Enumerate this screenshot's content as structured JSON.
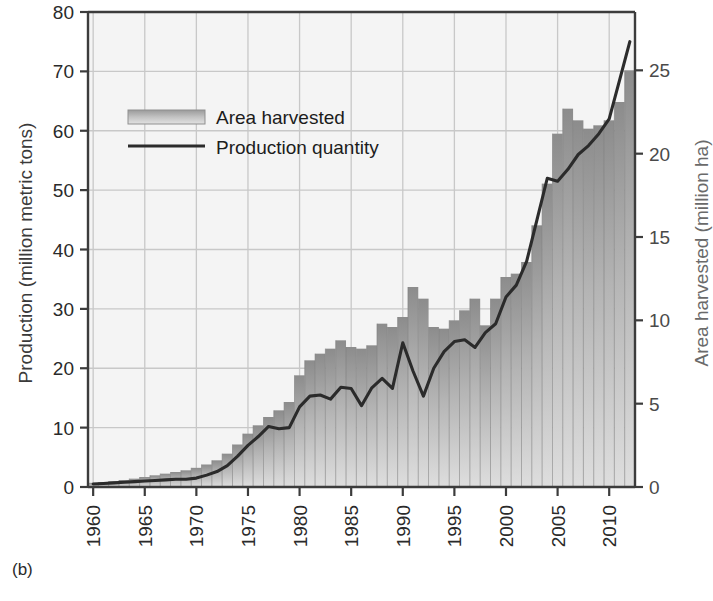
{
  "figure": {
    "panel_label": "(b)"
  },
  "chart_data": {
    "type": "bar",
    "title": "",
    "xlabel": "",
    "ylabel": "Production (million metric tons)",
    "y2label": "Area harvested (million ha)",
    "ylim": [
      0,
      80
    ],
    "y2lim": [
      0,
      28.5
    ],
    "xlim": [
      1959.5,
      2012.5
    ],
    "grid": true,
    "legend_position": "upper-left-inside",
    "yticks": [
      0,
      10,
      20,
      30,
      40,
      50,
      60,
      70,
      80
    ],
    "y2ticks": [
      0,
      5,
      10,
      15,
      20,
      25
    ],
    "xticks": [
      1960,
      1965,
      1970,
      1975,
      1980,
      1985,
      1990,
      1995,
      2000,
      2005,
      2010
    ],
    "colors": {
      "bar_top": "#8c8c8c",
      "bar_bottom": "#dcdcdc",
      "line": "#2b2b2b",
      "grid": "#c8c8c8",
      "plot_background": "#f4f4f4",
      "axis": "#3c3c3c"
    },
    "x": [
      1960,
      1961,
      1962,
      1963,
      1964,
      1965,
      1966,
      1967,
      1968,
      1969,
      1970,
      1971,
      1972,
      1973,
      1974,
      1975,
      1976,
      1977,
      1978,
      1979,
      1980,
      1981,
      1982,
      1983,
      1984,
      1985,
      1986,
      1987,
      1988,
      1989,
      1990,
      1991,
      1992,
      1993,
      1994,
      1995,
      1996,
      1997,
      1998,
      1999,
      2000,
      2001,
      2002,
      2003,
      2004,
      2005,
      2006,
      2007,
      2008,
      2009,
      2010,
      2011,
      2012
    ],
    "series": [
      {
        "name": "Area harvested",
        "axis": "right",
        "unit": "million ha",
        "render": "bar",
        "values": [
          0.25,
          0.3,
          0.35,
          0.42,
          0.5,
          0.6,
          0.7,
          0.8,
          0.9,
          1.0,
          1.15,
          1.35,
          1.6,
          2.0,
          2.55,
          3.2,
          3.7,
          4.2,
          4.6,
          5.1,
          6.7,
          7.6,
          8.0,
          8.3,
          8.8,
          8.4,
          8.3,
          8.5,
          9.8,
          9.6,
          10.2,
          12.0,
          11.3,
          9.6,
          9.5,
          10.0,
          10.6,
          11.3,
          9.7,
          11.3,
          12.6,
          12.8,
          13.5,
          15.7,
          18.2,
          21.2,
          22.7,
          22.0,
          21.5,
          21.7,
          22.0,
          23.1,
          25.0
        ]
      },
      {
        "name": "Production quantity",
        "axis": "left",
        "unit": "million metric tons",
        "render": "line",
        "values": [
          0.5,
          0.6,
          0.7,
          0.8,
          0.9,
          1.0,
          1.1,
          1.2,
          1.3,
          1.3,
          1.5,
          2.0,
          2.6,
          3.6,
          5.2,
          7.0,
          8.5,
          10.2,
          9.8,
          10.0,
          13.5,
          15.3,
          15.5,
          14.8,
          16.8,
          16.6,
          13.7,
          16.7,
          18.3,
          16.6,
          24.3,
          19.5,
          15.3,
          20.0,
          22.8,
          24.5,
          24.8,
          23.5,
          26.0,
          27.5,
          32.0,
          34.0,
          38.0,
          45.0,
          52.0,
          51.5,
          53.5,
          56.0,
          57.5,
          59.5,
          62.0,
          68.5,
          75.0
        ]
      }
    ],
    "legend": [
      {
        "label": "Area harvested",
        "marker": "gradient-swatch"
      },
      {
        "label": "Production quantity",
        "marker": "line"
      }
    ]
  }
}
